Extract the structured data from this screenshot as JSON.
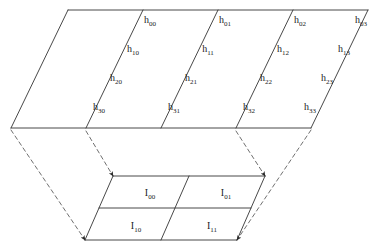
{
  "diagram": {
    "stroke_color": "#333333",
    "dashed_stroke_color": "#555555",
    "background_color": "#ffffff",
    "text_color": "#1a1a1a",
    "top_plane": {
      "name": "h-plane",
      "corners": {
        "top_left": [
          68,
          10
        ],
        "top_right": [
          368,
          10
        ],
        "bottom_right": [
          311,
          128
        ],
        "bottom_left": [
          11,
          128
        ]
      },
      "columns": 4,
      "rows": 4,
      "column_divider_top_x": [
        143,
        218,
        293
      ],
      "column_divider_bottom_x": [
        86,
        161,
        236
      ],
      "cells": [
        {
          "id": "h00",
          "base": "h",
          "sub": "00",
          "x": 150,
          "y": 23
        },
        {
          "id": "h01",
          "base": "h",
          "sub": "01",
          "x": 225,
          "y": 23
        },
        {
          "id": "h02",
          "base": "h",
          "sub": "02",
          "x": 300,
          "y": 23
        },
        {
          "id": "h03",
          "base": "h",
          "sub": "03",
          "x": 361,
          "y": 23
        },
        {
          "id": "h10",
          "base": "h",
          "sub": "10",
          "x": 133,
          "y": 52
        },
        {
          "id": "h11",
          "base": "h",
          "sub": "11",
          "x": 208,
          "y": 52
        },
        {
          "id": "h12",
          "base": "h",
          "sub": "12",
          "x": 283,
          "y": 52
        },
        {
          "id": "h13",
          "base": "h",
          "sub": "13",
          "x": 344,
          "y": 52
        },
        {
          "id": "h20",
          "base": "h",
          "sub": "20",
          "x": 116,
          "y": 81
        },
        {
          "id": "h21",
          "base": "h",
          "sub": "21",
          "x": 191,
          "y": 81
        },
        {
          "id": "h22",
          "base": "h",
          "sub": "22",
          "x": 266,
          "y": 81
        },
        {
          "id": "h23",
          "base": "h",
          "sub": "23",
          "x": 327,
          "y": 81
        },
        {
          "id": "h30",
          "base": "h",
          "sub": "30",
          "x": 99,
          "y": 110
        },
        {
          "id": "h31",
          "base": "h",
          "sub": "31",
          "x": 174,
          "y": 110
        },
        {
          "id": "h32",
          "base": "h",
          "sub": "32",
          "x": 249,
          "y": 110
        },
        {
          "id": "h33",
          "base": "h",
          "sub": "33",
          "x": 310,
          "y": 110
        }
      ]
    },
    "bottom_plane": {
      "name": "I-plane",
      "corners": {
        "top_left": [
          113,
          176
        ],
        "top_right": [
          265,
          176
        ],
        "bottom_right": [
          237,
          240
        ],
        "bottom_left": [
          85,
          240
        ]
      },
      "columns": 2,
      "rows": 2,
      "column_divider_top_x": [
        189
      ],
      "column_divider_bottom_x": [
        161
      ],
      "row_divider_left": [
        99,
        208
      ],
      "row_divider_right": [
        251,
        208
      ],
      "cells": [
        {
          "id": "I00",
          "base": "I",
          "sub": "00",
          "x": 150,
          "y": 196
        },
        {
          "id": "I01",
          "base": "I",
          "sub": "01",
          "x": 226,
          "y": 196
        },
        {
          "id": "I10",
          "base": "I",
          "sub": "10",
          "x": 136,
          "y": 229
        },
        {
          "id": "I11",
          "base": "I",
          "sub": "11",
          "x": 212,
          "y": 229
        }
      ]
    },
    "connectors": [
      {
        "id": "connector-left-outer",
        "from": [
          11,
          130
        ],
        "to": [
          85,
          240
        ],
        "arrow": true
      },
      {
        "id": "connector-left-inner",
        "from": [
          86,
          131
        ],
        "to": [
          113,
          176
        ],
        "arrow": true
      },
      {
        "id": "connector-right-inner",
        "from": [
          236,
          131
        ],
        "to": [
          265,
          176
        ],
        "arrow": true
      },
      {
        "id": "connector-right-outer",
        "from": [
          311,
          130
        ],
        "to": [
          237,
          240
        ],
        "arrow": true
      }
    ]
  }
}
